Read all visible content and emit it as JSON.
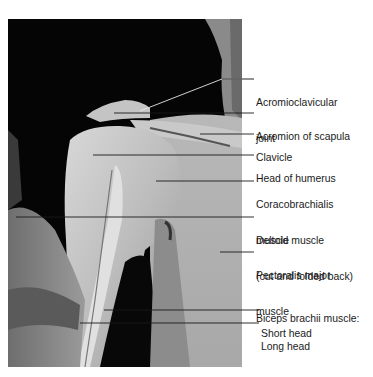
{
  "figure": {
    "photo_box": {
      "x": 8,
      "y": 19,
      "width": 234,
      "height": 348
    },
    "colors": {
      "background": "#ffffff",
      "photo_dark": "#050505",
      "tissue_light": "#cfcfcf",
      "leader_line": "#1a1a1a",
      "label_text": "#1a1a1a"
    }
  },
  "labels": [
    {
      "id": "acromioclavicular-joint",
      "lines": [
        "Acromioclavicular",
        "joint"
      ],
      "y": 73,
      "leader": {
        "points": [
          [
            140,
            111
          ],
          [
            222,
            79
          ],
          [
            254,
            79
          ]
        ]
      }
    },
    {
      "id": "acromion-of-scapula",
      "lines": [
        "Acromion of scapula"
      ],
      "y": 107,
      "leader": {
        "points": [
          [
            114,
            113
          ],
          [
            254,
            113
          ]
        ]
      }
    },
    {
      "id": "clavicle",
      "lines": [
        "Clavicle"
      ],
      "y": 128,
      "leader": {
        "points": [
          [
            200,
            134
          ],
          [
            254,
            134
          ]
        ]
      }
    },
    {
      "id": "head-of-humerus",
      "lines": [
        "Head of humerus"
      ],
      "y": 149,
      "leader": {
        "points": [
          [
            93,
            155
          ],
          [
            254,
            155
          ]
        ]
      }
    },
    {
      "id": "coracobrachialis-muscle",
      "lines": [
        "Coracobrachialis",
        "muscle"
      ],
      "y": 175,
      "leader": {
        "points": [
          [
            156,
            181
          ],
          [
            254,
            181
          ]
        ]
      }
    },
    {
      "id": "deltoid-muscle",
      "lines": [
        "Deltoid muscle",
        "(cut and folded back)"
      ],
      "y": 211,
      "leader": {
        "points": [
          [
            16,
            217
          ],
          [
            254,
            217
          ]
        ]
      }
    },
    {
      "id": "pectoralis-major-muscle",
      "lines": [
        "Pectoralis major",
        "muscle"
      ],
      "y": 246,
      "leader": {
        "points": [
          [
            220,
            252
          ],
          [
            254,
            252
          ]
        ]
      }
    },
    {
      "id": "biceps-brachii-muscle",
      "lines": [
        "Biceps brachii muscle:"
      ],
      "y": 289,
      "leader": null
    },
    {
      "id": "short-head",
      "lines": [
        "Short head"
      ],
      "y": 304,
      "indent": 6,
      "leader": {
        "points": [
          [
            104,
            310
          ],
          [
            259,
            310
          ]
        ]
      }
    },
    {
      "id": "long-head",
      "lines": [
        "Long head"
      ],
      "y": 317,
      "indent": 6,
      "leader": {
        "points": [
          [
            80,
            323
          ],
          [
            259,
            323
          ]
        ]
      }
    }
  ]
}
